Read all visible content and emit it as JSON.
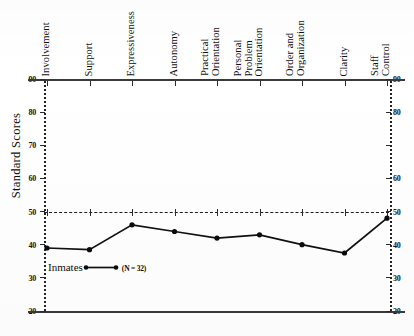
{
  "chart_data": {
    "type": "line",
    "title": "",
    "xlabel": "",
    "ylabel": "Standard Scores",
    "ylim": [
      20,
      90
    ],
    "yticks": [
      90,
      80,
      70,
      60,
      50,
      40,
      30,
      20
    ],
    "yticks_right": [
      90,
      80,
      "",
      60,
      50,
      40,
      30,
      20
    ],
    "grid": false,
    "legend_position": "inside-bottom-left",
    "reference_line": {
      "value": 50,
      "style": "dashed"
    },
    "categories": [
      "Involvement",
      "Support",
      "Expressiveness",
      "Autonomy",
      "Practical Orientation",
      "Personal Problem Orientation",
      "Order and Organization",
      "Clarity",
      "Staff Control"
    ],
    "categories_wrapped": [
      [
        "Involvement"
      ],
      [
        "Support"
      ],
      [
        "Expressiveness"
      ],
      [
        "Autonomy"
      ],
      [
        "Practical",
        "Orientation"
      ],
      [
        "Personal",
        "Problem",
        "Orientation"
      ],
      [
        "Order and",
        "Organization"
      ],
      [
        "Clarity"
      ],
      [
        "Staff",
        "Control"
      ]
    ],
    "series": [
      {
        "name": "Inmates",
        "n_label": "(N = 32)",
        "values": [
          39,
          38.5,
          46,
          44,
          42,
          43,
          40,
          37.5,
          48
        ]
      }
    ]
  },
  "axes": {
    "y_title": "Standard Scores"
  },
  "legend": {
    "series_label": "Inmates",
    "n_text": "(N = 32)"
  }
}
